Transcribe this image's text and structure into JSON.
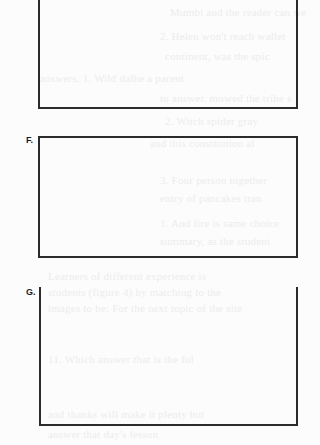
{
  "page": {
    "background": "#fcfcfc",
    "border_color": "#2b2b2b"
  },
  "answer_boxes": [
    {
      "id": "E",
      "label": "",
      "top_border": true
    },
    {
      "id": "F",
      "label": "F.",
      "top_border": true
    },
    {
      "id": "G",
      "label": "G.",
      "top_border": false
    }
  ],
  "bleed_through_text": [
    "Mumbi and the reader can wel",
    "2. Helen won't reach wallet",
    "continent, was the spic",
    "answers. 1. Wild dalhe a parent",
    "to answer. mowed the tribe s",
    "2. Witch spider gray",
    "and this constitution al",
    "3. Four person together",
    "entry of pancakes tran",
    "1. And fire is same choice",
    "summary, as the student",
    "Learners of different experience is",
    "students (figure 4) by matching to the",
    "images to be: For the next topic of the site",
    "11. Which answer that is the ful",
    "and thanks will make it plenty but",
    "answer that day's lesson"
  ]
}
